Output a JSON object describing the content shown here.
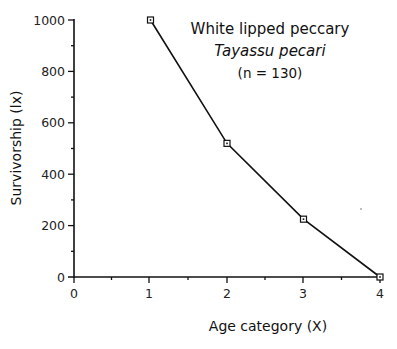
{
  "chart_data": {
    "type": "line",
    "title": "",
    "annotation": {
      "common_name": "White lipped peccary",
      "scientific_name": "Tayassu pecari",
      "sample_size": "(n = 130)"
    },
    "xlabel": "Age category (X)",
    "ylabel": "Survivorship (lx)",
    "xlim": [
      0,
      4
    ],
    "ylim": [
      0,
      1000
    ],
    "x_ticks": [
      "0",
      "1",
      "2",
      "3",
      "4"
    ],
    "y_ticks": [
      "0",
      "200",
      "400",
      "600",
      "800",
      "1000"
    ],
    "grid": false,
    "legend": "none",
    "marker": "open-square",
    "series": [
      {
        "name": "White lipped peccary",
        "x": [
          1,
          2,
          3,
          4
        ],
        "values": [
          1000,
          520,
          225,
          0
        ]
      }
    ]
  }
}
